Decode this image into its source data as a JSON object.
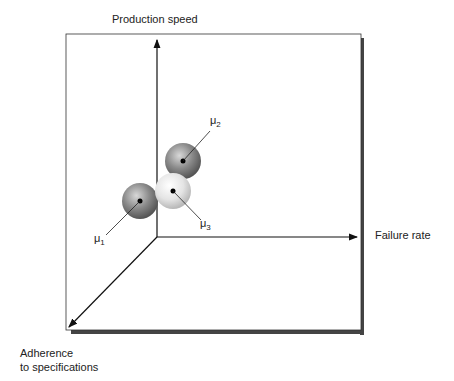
{
  "diagram": {
    "type": "3d-axes-clusters",
    "axes": {
      "y": "Production speed",
      "x": "Failure rate",
      "z_line1": "Adherence",
      "z_line2": "to specifications"
    },
    "clusters": [
      {
        "label": "μ",
        "sub": "1",
        "shade": "dark"
      },
      {
        "label": "μ",
        "sub": "2",
        "shade": "dark"
      },
      {
        "label": "μ",
        "sub": "3",
        "shade": "light"
      }
    ]
  }
}
